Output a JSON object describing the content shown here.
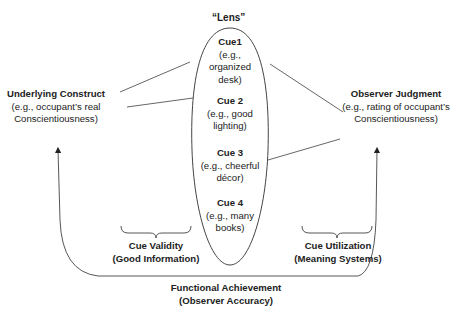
{
  "lens": {
    "title": "“Lens”",
    "cues": [
      {
        "name": "Cue1",
        "example_lines": [
          "(e.g.,",
          "organized",
          "desk)"
        ]
      },
      {
        "name": "Cue 2",
        "example_lines": [
          "(e.g., good",
          "lighting)"
        ]
      },
      {
        "name": "Cue 3",
        "example_lines": [
          "(e.g., cheerful",
          "décor)"
        ]
      },
      {
        "name": "Cue 4",
        "example_lines": [
          "(e.g., many",
          "books)"
        ]
      }
    ]
  },
  "construct": {
    "title": "Underlying Construct",
    "lines": [
      "(e.g., occupant’s real",
      "Conscientiousness)"
    ]
  },
  "judgment": {
    "title": "Observer Judgment",
    "lines": [
      "(e.g., rating of occupant’s",
      "Conscientiousness)"
    ]
  },
  "cue_validity": {
    "title": "Cue Validity",
    "subtitle": "(Good Information)"
  },
  "cue_utilization": {
    "title": "Cue Utilization",
    "subtitle": "(Meaning Systems)"
  },
  "achievement": {
    "title": "Functional Achievement",
    "subtitle": "(Observer Accuracy)"
  },
  "colors": {
    "stroke": "#444444",
    "text": "#222222"
  }
}
